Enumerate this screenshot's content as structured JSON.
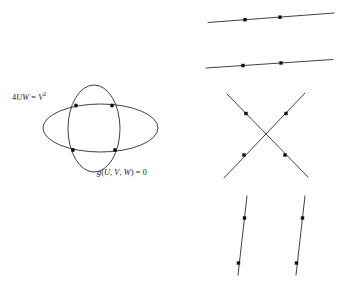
{
  "figure": {
    "background_color": "#ffffff",
    "stroke_color": "#2b2b2b",
    "point_color": "#111111",
    "labels": {
      "quadric": {
        "text": "4UW = V2",
        "lhs_coefficient": "4",
        "lhs_vars": "UW",
        "relation": "=",
        "rhs_var": "V",
        "rhs_exponent": "2"
      },
      "cubic": {
        "text": "g(U, V, W) = 0",
        "function_name": "g",
        "open_paren": "(",
        "arg1": "U",
        "comma1": ",",
        "arg2": "V",
        "comma2": ",",
        "arg3": "W",
        "close_paren": ")",
        "relation": "=",
        "value": "0"
      }
    },
    "panels": [
      {
        "name": "two-ellipses",
        "description": "horizontal ellipse and vertical ellipse intersecting in four points",
        "intersection_count": "4"
      },
      {
        "name": "two-near-parallel-lines",
        "description": "two shallow lines sloping up to the right, two marked points on each",
        "intersection_count": "4"
      },
      {
        "name": "two-crossing-lines",
        "description": "two lines crossing in an X, two marked points on each",
        "intersection_count": "4"
      },
      {
        "name": "two-near-vertical-lines",
        "description": "two steep lines tilting toward each other, two marked points on each",
        "intersection_count": "4"
      }
    ]
  },
  "chart_data": {
    "type": "scatter",
    "title": "",
    "xlabel": "",
    "ylabel": "",
    "grid": false,
    "legend": "none",
    "annotations": [
      "4UW = V2",
      "g(U, V, W) = 0"
    ],
    "curves": [
      {
        "name": "horizontal-ellipse",
        "label": "4UW = V2",
        "shape": "ellipse",
        "cx": 100.5,
        "cy": 128,
        "rx": 57.5,
        "ry": 24
      },
      {
        "name": "vertical-ellipse",
        "label": "g(U, V, W) = 0",
        "shape": "ellipse",
        "cx": 94,
        "cy": 128.5,
        "rx": 26,
        "ry": 43.5
      },
      {
        "name": "parallel-line-upper",
        "shape": "line",
        "x1": 208,
        "y1": 22.5,
        "x2": 334,
        "y2": 13
      },
      {
        "name": "parallel-line-lower",
        "shape": "line",
        "x1": 206,
        "y1": 68,
        "x2": 333,
        "y2": 59.5
      },
      {
        "name": "crossing-line-down-right",
        "shape": "line",
        "x1": 227,
        "y1": 94,
        "x2": 308,
        "y2": 177
      },
      {
        "name": "crossing-line-up-right",
        "shape": "line",
        "x1": 224,
        "y1": 178,
        "x2": 305,
        "y2": 93
      },
      {
        "name": "vertical-line-left",
        "shape": "line",
        "x1": 247,
        "y1": 196,
        "x2": 238,
        "y2": 275
      },
      {
        "name": "vertical-line-right",
        "shape": "line",
        "x1": 305,
        "y1": 196,
        "x2": 296,
        "y2": 275
      }
    ],
    "points": [
      {
        "group": "two-ellipses",
        "x": 76,
        "y": 105.5
      },
      {
        "group": "two-ellipses",
        "x": 112,
        "y": 105.5
      },
      {
        "group": "two-ellipses",
        "x": 73,
        "y": 150
      },
      {
        "group": "two-ellipses",
        "x": 115,
        "y": 150
      },
      {
        "group": "two-near-parallel-lines",
        "x": 245,
        "y": 19.7
      },
      {
        "group": "two-near-parallel-lines",
        "x": 280,
        "y": 17.2
      },
      {
        "group": "two-near-parallel-lines",
        "x": 243,
        "y": 65.5
      },
      {
        "group": "two-near-parallel-lines",
        "x": 281,
        "y": 63
      },
      {
        "group": "two-crossing-lines",
        "x": 246,
        "y": 113.5
      },
      {
        "group": "two-crossing-lines",
        "x": 286,
        "y": 113.5
      },
      {
        "group": "two-crossing-lines",
        "x": 244,
        "y": 155
      },
      {
        "group": "two-crossing-lines",
        "x": 285,
        "y": 155
      },
      {
        "group": "two-near-vertical-lines",
        "x": 244.5,
        "y": 218
      },
      {
        "group": "two-near-vertical-lines",
        "x": 302.5,
        "y": 218
      },
      {
        "group": "two-near-vertical-lines",
        "x": 238.5,
        "y": 263
      },
      {
        "group": "two-near-vertical-lines",
        "x": 296.5,
        "y": 263
      }
    ]
  }
}
